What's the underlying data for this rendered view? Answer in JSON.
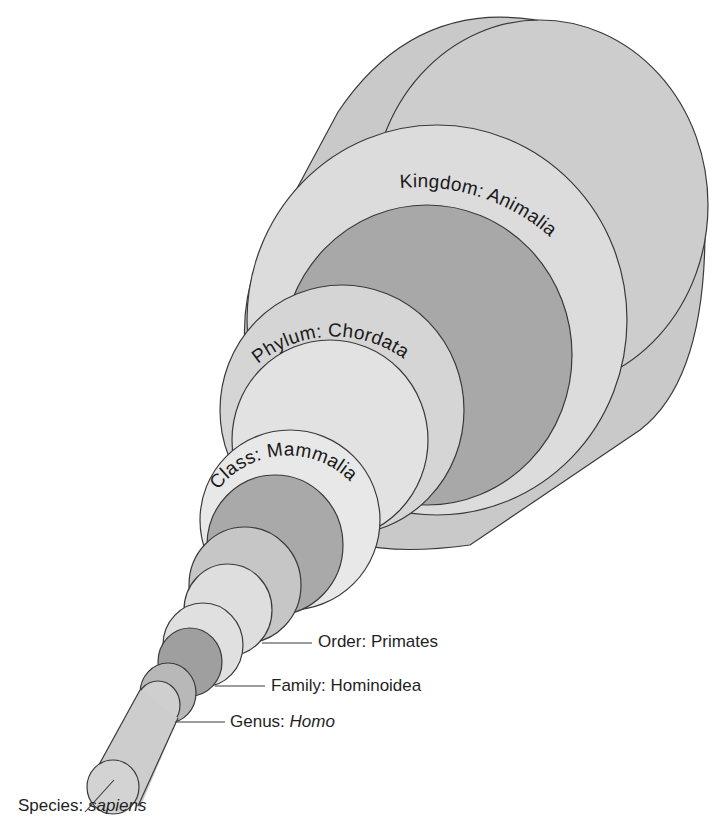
{
  "colors": {
    "background": "#ffffff",
    "outline": "#3a3a3a",
    "light": "#dcdcdc",
    "lighter": "#e6e6e6",
    "mid": "#c8c8c8",
    "dark": "#a9a9a9",
    "darker": "#9c9c9c",
    "text": "#1a1a1a"
  },
  "levels": [
    {
      "rank": "Kingdom",
      "separator": ": ",
      "name": "Animalia",
      "italic": false,
      "label_style": "curved"
    },
    {
      "rank": "Phylum",
      "separator": ": ",
      "name": "Chordata",
      "italic": false,
      "label_style": "curved"
    },
    {
      "rank": "Class",
      "separator": ": ",
      "name": "Mammalia",
      "italic": false,
      "label_style": "curved"
    },
    {
      "rank": "Order",
      "separator": ": ",
      "name": "Primates",
      "italic": false,
      "label_style": "leader-line"
    },
    {
      "rank": "Family",
      "separator": ": ",
      "name": "Hominoidea",
      "italic": false,
      "label_style": "leader-line"
    },
    {
      "rank": "Genus",
      "separator": ": ",
      "name": "Homo",
      "italic": true,
      "label_style": "leader-line"
    },
    {
      "rank": "Species",
      "separator": ": ",
      "name": "sapiens",
      "italic": true,
      "label_style": "leader-line"
    }
  ],
  "curved_labels": {
    "kingdom": "Kingdom: Animalia",
    "phylum": "Phylum: Chordata",
    "class": "Class: Mammalia"
  }
}
